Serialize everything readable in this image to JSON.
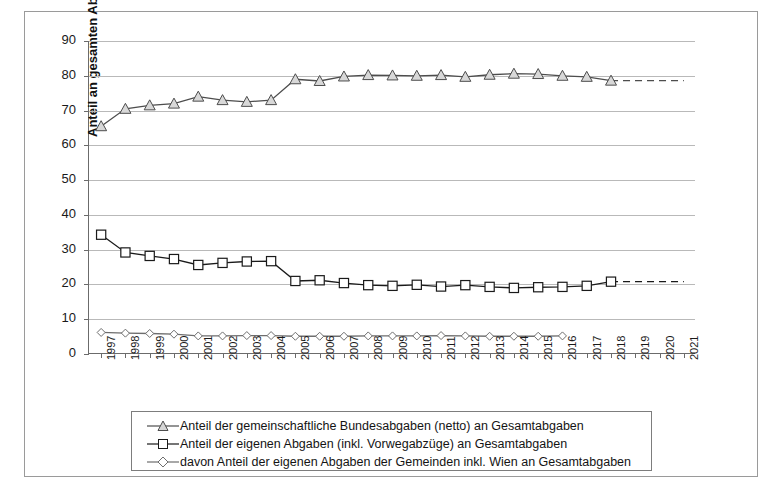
{
  "page": {
    "clipped_heading": "zent"
  },
  "chart_data": {
    "type": "line",
    "title": "",
    "xlabel": "",
    "ylabel": "Anteil an gesamten Abgaben in %",
    "ylim": [
      0,
      90
    ],
    "ytick_step": 10,
    "yticks": [
      0,
      10,
      20,
      30,
      40,
      50,
      60,
      70,
      80,
      90
    ],
    "grid": true,
    "legend_position": "bottom",
    "x": [
      1997,
      1998,
      1999,
      2000,
      2001,
      2002,
      2003,
      2004,
      2005,
      2006,
      2007,
      2008,
      2009,
      2010,
      2011,
      2012,
      2013,
      2014,
      2015,
      2016,
      2017,
      2018,
      2019,
      2020,
      2021
    ],
    "categories": [
      "1997",
      "1998",
      "1999",
      "2000",
      "2001",
      "2002",
      "2003",
      "2004",
      "2005",
      "2006",
      "2007",
      "2008",
      "2009",
      "2010",
      "2011",
      "2012",
      "2013",
      "2014",
      "2015",
      "2016",
      "2017",
      "2018",
      "2019",
      "2020",
      "2021"
    ],
    "series": [
      {
        "name": "Anteil der gemeinschaftliche Bundesabgaben (netto) an Gesamtabgaben",
        "marker": "triangle",
        "color": "#4d4d4d",
        "values": [
          65.5,
          70.5,
          71.5,
          72.0,
          74.0,
          73.0,
          72.5,
          73.0,
          79.0,
          78.5,
          79.8,
          80.2,
          80.1,
          80.0,
          80.2,
          79.7,
          80.3,
          80.6,
          80.5,
          80.0,
          79.7,
          78.6,
          null,
          null,
          null
        ],
        "dashed_from": 2016,
        "projection_end_value": 78.6,
        "projection_end_x": 2021
      },
      {
        "name": "Anteil der eigenen Abgaben (inkl. Vorwegabzüge) an Gesamtabgaben",
        "marker": "square",
        "color": "#1a1a1a",
        "values": [
          34.3,
          29.2,
          28.2,
          27.3,
          25.6,
          26.2,
          26.6,
          26.7,
          21.0,
          21.2,
          20.4,
          19.8,
          19.6,
          19.9,
          19.4,
          19.8,
          19.3,
          19.0,
          19.2,
          19.3,
          19.6,
          20.8,
          null,
          null,
          null
        ],
        "dashed_from": 2016,
        "projection_end_value": 20.8,
        "projection_end_x": 2021
      },
      {
        "name": "davon Anteil der eigenen Abgaben der Gemeinden inkl. Wien an Gesamtabgaben",
        "marker": "diamond",
        "color": "#6e6e6e",
        "values": [
          6.2,
          6.0,
          5.9,
          5.7,
          5.2,
          5.2,
          5.3,
          5.3,
          5.1,
          5.1,
          5.1,
          5.2,
          5.2,
          5.2,
          5.3,
          5.2,
          5.1,
          5.1,
          5.1,
          5.2,
          null,
          null,
          null,
          null,
          null
        ],
        "dashed_from": null
      }
    ]
  },
  "legend": {
    "items": [
      {
        "symbol": "triangle-marker",
        "label": "Anteil der gemeinschaftliche Bundesabgaben (netto) an Gesamtabgaben"
      },
      {
        "symbol": "square-marker",
        "label": "Anteil der eigenen Abgaben (inkl. Vorwegabzüge) an Gesamtabgaben"
      },
      {
        "symbol": "diamond-marker",
        "label": "davon Anteil der eigenen Abgaben der Gemeinden inkl. Wien an Gesamtabgaben"
      }
    ]
  }
}
